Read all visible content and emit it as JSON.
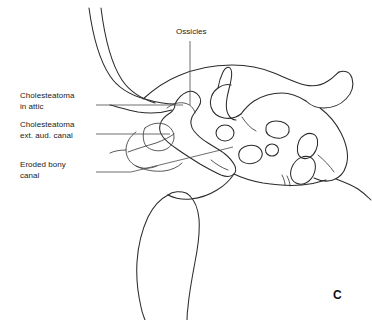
{
  "figure": {
    "panel_letter": "C",
    "accent_color": "#2b2b2b",
    "background_color": "#ffffff"
  },
  "labels": {
    "ossicles": "Ossicles",
    "cholesteatoma_attic_line1": "Cholesteatoma",
    "cholesteatoma_attic_line2": "in attic",
    "cholesteatoma_canal_line1": "Cholesteatoma",
    "cholesteatoma_canal_line2": "ext. aud. canal",
    "eroded_bony_line1": "Eroded bony",
    "eroded_bony_line2": "canal"
  }
}
